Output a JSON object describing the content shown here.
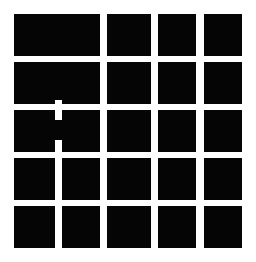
{
  "figure": {
    "width": 256,
    "height": 262,
    "background_color": "#ffffff",
    "block_color": "#050505",
    "notch_color": "#ffffff",
    "rows": 5,
    "columns": 4,
    "left_column_spans": 2
  },
  "geometry": {
    "columns": [
      {
        "name": "column-1-wide",
        "x": 14,
        "width": 86
      },
      {
        "name": "column-2",
        "x": 107,
        "width": 44
      },
      {
        "name": "column-3",
        "x": 158,
        "width": 38
      },
      {
        "name": "column-4",
        "x": 204,
        "width": 38
      }
    ],
    "rows": [
      {
        "name": "row-1",
        "y": 14,
        "height": 42
      },
      {
        "name": "row-2",
        "y": 62,
        "height": 42
      },
      {
        "name": "row-3",
        "y": 110,
        "height": 42
      },
      {
        "name": "row-4",
        "y": 158,
        "height": 42
      },
      {
        "name": "row-5",
        "y": 206,
        "height": 42
      }
    ],
    "notch": {
      "x": 55,
      "width": 7,
      "y_start": 100,
      "y_end": 248
    }
  },
  "blocks": [
    {
      "name": "block-r1c1",
      "row": 1,
      "col": 1,
      "x": 14,
      "y": 14,
      "w": 86,
      "h": 42
    },
    {
      "name": "block-r1c2",
      "row": 1,
      "col": 2,
      "x": 107,
      "y": 14,
      "w": 44,
      "h": 42
    },
    {
      "name": "block-r1c3",
      "row": 1,
      "col": 3,
      "x": 158,
      "y": 14,
      "w": 38,
      "h": 42
    },
    {
      "name": "block-r1c4",
      "row": 1,
      "col": 4,
      "x": 204,
      "y": 14,
      "w": 38,
      "h": 42
    },
    {
      "name": "block-r2c1",
      "row": 2,
      "col": 1,
      "x": 14,
      "y": 62,
      "w": 86,
      "h": 42
    },
    {
      "name": "block-r2c2",
      "row": 2,
      "col": 2,
      "x": 107,
      "y": 62,
      "w": 44,
      "h": 42
    },
    {
      "name": "block-r2c3",
      "row": 2,
      "col": 3,
      "x": 158,
      "y": 62,
      "w": 38,
      "h": 42
    },
    {
      "name": "block-r2c4",
      "row": 2,
      "col": 4,
      "x": 204,
      "y": 62,
      "w": 38,
      "h": 42
    },
    {
      "name": "block-r3c1",
      "row": 3,
      "col": 1,
      "x": 14,
      "y": 110,
      "w": 86,
      "h": 42
    },
    {
      "name": "block-r3c2",
      "row": 3,
      "col": 2,
      "x": 107,
      "y": 110,
      "w": 44,
      "h": 42
    },
    {
      "name": "block-r3c3",
      "row": 3,
      "col": 3,
      "x": 158,
      "y": 110,
      "w": 38,
      "h": 42
    },
    {
      "name": "block-r3c4",
      "row": 3,
      "col": 4,
      "x": 204,
      "y": 110,
      "w": 38,
      "h": 42
    },
    {
      "name": "block-r4c1",
      "row": 4,
      "col": 1,
      "x": 14,
      "y": 158,
      "w": 86,
      "h": 42
    },
    {
      "name": "block-r4c2",
      "row": 4,
      "col": 2,
      "x": 107,
      "y": 158,
      "w": 44,
      "h": 42
    },
    {
      "name": "block-r4c3",
      "row": 4,
      "col": 3,
      "x": 158,
      "y": 158,
      "w": 38,
      "h": 42
    },
    {
      "name": "block-r4c4",
      "row": 4,
      "col": 4,
      "x": 204,
      "y": 158,
      "w": 38,
      "h": 42
    },
    {
      "name": "block-r5c1",
      "row": 5,
      "col": 1,
      "x": 14,
      "y": 206,
      "w": 86,
      "h": 42
    },
    {
      "name": "block-r5c2",
      "row": 5,
      "col": 2,
      "x": 107,
      "y": 206,
      "w": 44,
      "h": 42
    },
    {
      "name": "block-r5c3",
      "row": 5,
      "col": 3,
      "x": 158,
      "y": 206,
      "w": 38,
      "h": 42
    },
    {
      "name": "block-r5c4",
      "row": 5,
      "col": 4,
      "x": 204,
      "y": 206,
      "w": 38,
      "h": 42
    }
  ],
  "notches": [
    {
      "name": "notch-row2-lower",
      "x": 55,
      "y": 100,
      "w": 7,
      "h": 4
    },
    {
      "name": "notch-row3-upper",
      "x": 55,
      "y": 110,
      "w": 7,
      "h": 10
    },
    {
      "name": "notch-row3-lower",
      "x": 55,
      "y": 140,
      "w": 7,
      "h": 12
    },
    {
      "name": "notch-row4-full",
      "x": 55,
      "y": 158,
      "w": 7,
      "h": 42
    },
    {
      "name": "notch-row5-upper",
      "x": 55,
      "y": 206,
      "w": 7,
      "h": 42
    }
  ]
}
